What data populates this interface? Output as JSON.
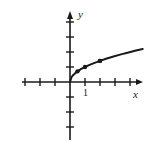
{
  "figure": {
    "name": "square-root-function-graph",
    "background_color": "#ffffff",
    "stroke_color": "#1a1a1a",
    "width": 149,
    "height": 142
  },
  "axes": {
    "x_label": "x",
    "y_label": "y",
    "origin_px": {
      "x": 70,
      "y": 82
    },
    "unit_px": 15,
    "x_axis": {
      "start_px": 22,
      "end_px": 143,
      "arrow": "right",
      "tick_count_negative": 3,
      "tick_count_positive": 4,
      "tick_half_length_px": 4
    },
    "y_axis": {
      "start_px": 12,
      "end_px": 140,
      "arrow": "up",
      "tick_count_positive": 4,
      "tick_count_negative": 3,
      "tick_half_length_px": 4
    }
  },
  "tick_labels": {
    "x": [
      {
        "value": "1",
        "x_units": 1
      }
    ],
    "y": []
  },
  "chart_data": {
    "type": "line",
    "title": "",
    "subtitle": "",
    "xlabel": "x",
    "ylabel": "y",
    "xlim": [
      -3.2,
      4.9
    ],
    "ylim": [
      -3.9,
      4.7
    ],
    "grid": false,
    "legend": null,
    "legend_position": "none",
    "series": [
      {
        "name": "y = sqrt(x)",
        "style": "solid",
        "color": "#1a1a1a",
        "line_width": 2,
        "x": [
          0,
          0.1,
          0.2,
          0.35,
          0.5,
          0.75,
          1,
          1.3,
          1.6,
          2,
          2.4,
          2.9,
          3.4,
          3.9,
          4.4,
          4.85
        ],
        "y": [
          0,
          0.32,
          0.45,
          0.59,
          0.71,
          0.87,
          1,
          1.14,
          1.26,
          1.41,
          1.55,
          1.7,
          1.84,
          1.97,
          2.1,
          2.2
        ]
      }
    ],
    "annotations": [
      {
        "type": "point-marker",
        "x": 0,
        "y": 0,
        "label": ""
      },
      {
        "type": "point-marker",
        "x": 0.5,
        "y": 0.71,
        "label": ""
      },
      {
        "type": "point-marker",
        "x": 1,
        "y": 1,
        "label": ""
      },
      {
        "type": "point-marker",
        "x": 2,
        "y": 1.41,
        "label": ""
      }
    ]
  }
}
